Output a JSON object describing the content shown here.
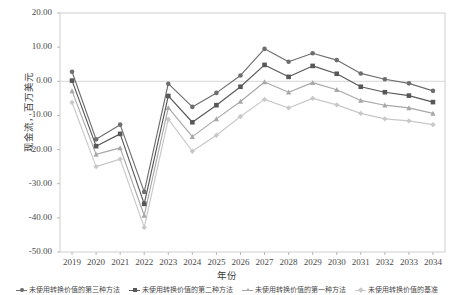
{
  "chart_data": {
    "type": "line",
    "title": "",
    "xlabel": "年份",
    "ylabel": "现金流，百万美元",
    "x": [
      2019,
      2020,
      2021,
      2022,
      2023,
      2024,
      2025,
      2026,
      2027,
      2028,
      2029,
      2030,
      2031,
      2032,
      2033,
      2034
    ],
    "categories": [
      "2019",
      "2020",
      "2021",
      "2022",
      "2023",
      "2024",
      "2025",
      "2026",
      "2027",
      "2028",
      "2029",
      "2030",
      "2031",
      "2032",
      "2033",
      "2034"
    ],
    "ylim": [
      -50.0,
      20.0
    ],
    "yticks": [
      20.0,
      10.0,
      0.0,
      -10.0,
      -20.0,
      -30.0,
      -40.0,
      -50.0
    ],
    "ytick_labels": [
      "20.00",
      "10.00",
      "0.00",
      "-10.00",
      "-20.00",
      "-30.00",
      "-40.00",
      "-50.00"
    ],
    "grid": false,
    "zero_line": true,
    "legend_position": "bottom",
    "series": [
      {
        "name": "未使用转换价值的第三种方法",
        "marker": "circle",
        "color": "#6e6e6e",
        "values": [
          2.8,
          -17.0,
          -12.7,
          -32.4,
          -0.7,
          -7.5,
          -3.4,
          1.7,
          9.5,
          5.7,
          8.2,
          6.2,
          2.3,
          0.6,
          -0.6,
          -2.8
        ]
      },
      {
        "name": "未使用转换价值的第二种方法",
        "marker": "square",
        "color": "#585858",
        "values": [
          0.2,
          -19.0,
          -15.4,
          -35.9,
          -4.3,
          -12.0,
          -7.0,
          -1.6,
          4.8,
          1.3,
          4.5,
          2.2,
          -1.6,
          -3.2,
          -4.2,
          -6.1
        ]
      },
      {
        "name": "未使用转换价值的第一种方法",
        "marker": "triangle",
        "color": "#a8a8a8",
        "values": [
          -2.8,
          -21.4,
          -19.5,
          -39.3,
          -7.7,
          -16.2,
          -11.0,
          -5.9,
          -0.2,
          -3.2,
          -0.4,
          -2.5,
          -5.6,
          -7.0,
          -7.8,
          -9.4
        ]
      },
      {
        "name": "未使用转换价值的基准",
        "marker": "diamond",
        "color": "#c8c8c8",
        "values": [
          -6.2,
          -25.0,
          -22.8,
          -42.8,
          -11.1,
          -20.5,
          -15.8,
          -10.3,
          -5.3,
          -7.8,
          -5.0,
          -6.9,
          -9.4,
          -11.0,
          -11.6,
          -12.7
        ]
      }
    ]
  },
  "axes": {
    "y_title": "现金流，百万美元",
    "x_title": "年份",
    "plot_border_color": "#cfcfcf",
    "zero_line_color": "#d6d6d6",
    "tick_color": "#b8b8b8"
  },
  "legend": {
    "items": [
      {
        "label": "未使用转换价值的第三种方法",
        "marker": "circle",
        "color": "#6e6e6e"
      },
      {
        "label": "未使用转换价值的第二种方法",
        "marker": "square",
        "color": "#585858"
      },
      {
        "label": "未使用转换价值的第一种方法",
        "marker": "triangle",
        "color": "#a8a8a8"
      },
      {
        "label": "未使用转换价值的基准",
        "marker": "diamond",
        "color": "#c8c8c8"
      }
    ]
  }
}
